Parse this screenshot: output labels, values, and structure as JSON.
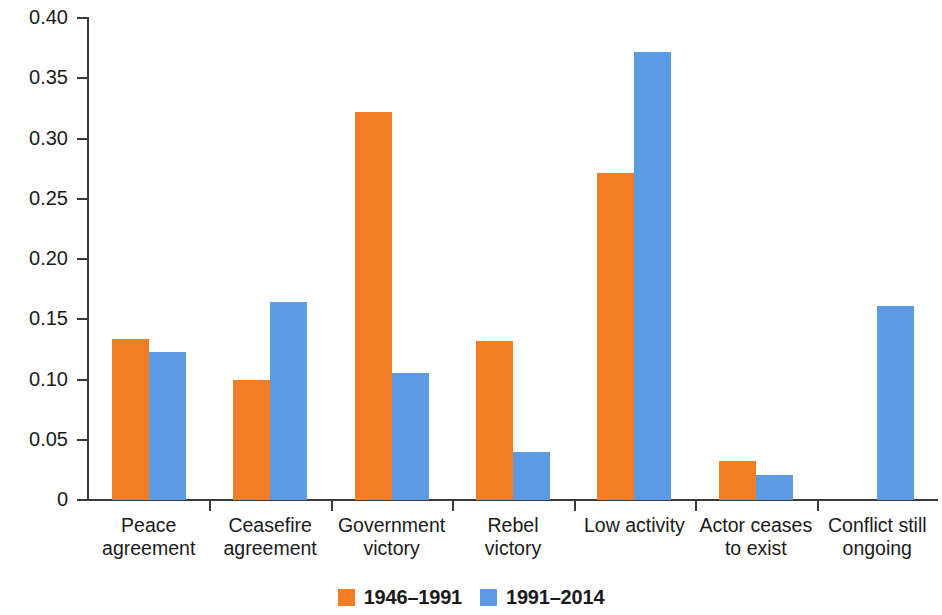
{
  "chart_data": {
    "type": "bar",
    "title": "",
    "xlabel": "",
    "ylabel": "Proportion of all state-based violent conflicts",
    "ylim": [
      0,
      0.4
    ],
    "ytick_labels": [
      "0",
      "0.05",
      "0.10",
      "0.15",
      "0.20",
      "0.25",
      "0.30",
      "0.35",
      "0.40"
    ],
    "ytick_values": [
      0,
      0.05,
      0.1,
      0.15,
      0.2,
      0.25,
      0.3,
      0.35,
      0.4
    ],
    "grid": false,
    "legend_position": "bottom-center",
    "categories": [
      "Peace\nagreement",
      "Ceasefire\nagreement",
      "Government\nvictory",
      "Rebel\nvictory",
      "Low activity",
      "Actor ceases\nto exist",
      "Conflict still\nongoing"
    ],
    "series": [
      {
        "name": "1946–1991",
        "color": "#f37c27",
        "values": [
          0.134,
          0.1,
          0.322,
          0.132,
          0.271,
          0.032,
          0.0
        ]
      },
      {
        "name": "1991–2014",
        "color": "#5b9be4",
        "values": [
          0.123,
          0.164,
          0.105,
          0.04,
          0.372,
          0.021,
          0.161
        ]
      }
    ]
  },
  "legend": {
    "items": [
      {
        "label": "1946–1991",
        "color": "#f37c27"
      },
      {
        "label": "1991–2014",
        "color": "#5b9be4"
      }
    ]
  }
}
